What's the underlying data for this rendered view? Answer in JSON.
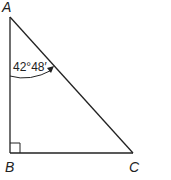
{
  "diagram": {
    "type": "right-triangle",
    "vertices": {
      "A": {
        "label": "A"
      },
      "B": {
        "label": "B"
      },
      "C": {
        "label": "C"
      }
    },
    "right_angle_at": "B",
    "angle_at_A": {
      "degrees": "42",
      "minutes": "48",
      "label": "42°48′"
    },
    "colors": {
      "stroke": "#222222",
      "background": "#ffffff"
    }
  }
}
